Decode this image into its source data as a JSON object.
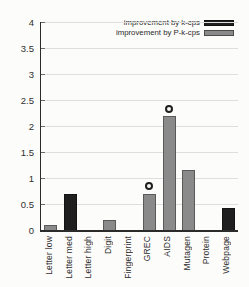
{
  "figure": {
    "background": "#fcfcfa",
    "text_color": "#2e2e2e",
    "axis_color": "#2b2b2b",
    "grid_color": "#dedede"
  },
  "chart_data": {
    "type": "bar",
    "title": "",
    "xlabel": "",
    "ylabel": "",
    "categories": [
      "Letter low",
      "Letter med",
      "Letter high",
      "Digit",
      "Fingerprint",
      "GREC",
      "AIDS",
      "Mutagen",
      "Protein",
      "Webpage"
    ],
    "series": [
      {
        "name": "improvement by k-cps",
        "color": "#1f1f1f",
        "values": [
          0,
          0.7,
          0,
          0,
          0,
          0,
          0,
          0,
          0,
          0.42
        ]
      },
      {
        "name": "improvement by P-k-cps",
        "color": "#8a8a8a",
        "values": [
          0.1,
          0,
          0,
          0.2,
          0,
          0.7,
          2.2,
          1.15,
          0,
          0
        ]
      }
    ],
    "markers": {
      "symbol": "open-circle",
      "points": [
        {
          "category": "GREC",
          "y": 0.85
        },
        {
          "category": "AIDS",
          "y": 2.32
        }
      ]
    },
    "ylim": [
      0,
      4
    ],
    "yticks": [
      0,
      0.5,
      1,
      1.5,
      2,
      2.5,
      3,
      3.5,
      4
    ],
    "grid": true,
    "legend_position": "top-right"
  }
}
